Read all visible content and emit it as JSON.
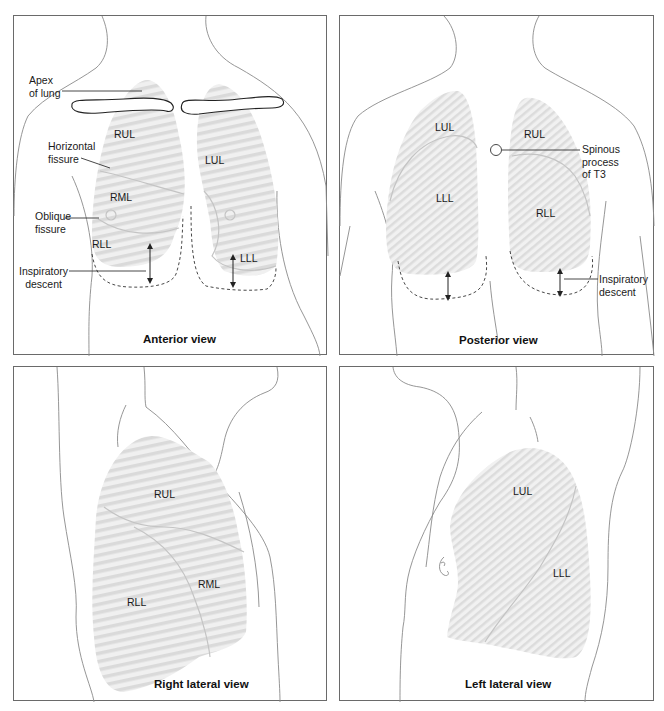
{
  "figure": {
    "colors": {
      "lung_fill": "#efefef",
      "lung_stripe": "#dcdcdc",
      "outline": "#8a8a8a",
      "text": "#1a1a1a"
    },
    "panels": {
      "anterior": {
        "title": "Anterior view",
        "lobes": {
          "rul": "RUL",
          "rml": "RML",
          "rll": "RLL",
          "lul": "LUL",
          "lll": "LLL"
        },
        "labels": {
          "apex_line1": "Apex",
          "apex_line2": "of lung",
          "horizontal_line1": "Horizontal",
          "horizontal_line2": "fissure",
          "oblique_line1": "Oblique",
          "oblique_line2": "fissure",
          "inspiratory_line1": "Inspiratory",
          "inspiratory_line2": "descent"
        }
      },
      "posterior": {
        "title": "Posterior view",
        "lobes": {
          "lul": "LUL",
          "lll": "LLL",
          "rul": "RUL",
          "rll": "RLL"
        },
        "labels": {
          "spinous_line1": "Spinous",
          "spinous_line2": "process",
          "spinous_line3": "of T3",
          "inspiratory_line1": "Inspiratory",
          "inspiratory_line2": "descent"
        }
      },
      "right_lateral": {
        "title": "Right lateral view",
        "lobes": {
          "rul": "RUL",
          "rml": "RML",
          "rll": "RLL"
        }
      },
      "left_lateral": {
        "title": "Left lateral view",
        "lobes": {
          "lul": "LUL",
          "lll": "LLL"
        }
      }
    }
  }
}
